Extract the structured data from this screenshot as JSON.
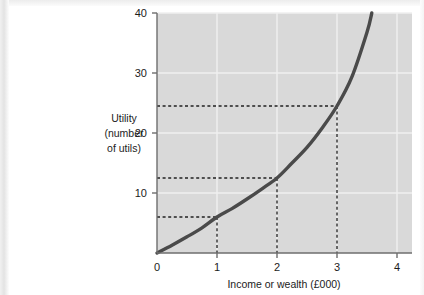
{
  "figure": {
    "background_color": "#ffffff",
    "plot_background_color": "#d9d9d9",
    "curve_color": "#4a4a4a",
    "axis_color": "#6e6e6e",
    "gridline_color": "#efefef",
    "text_color": "#1c1c1c"
  },
  "chart_data": {
    "type": "line",
    "title": "",
    "subtitle": "",
    "xlabel": "Income or wealth (£000)",
    "ylabel": "Utility (number of utils)",
    "ylabel_lines": [
      "Utility",
      "(number",
      "of utils)"
    ],
    "xlim": [
      0,
      4.25
    ],
    "ylim": [
      0,
      40
    ],
    "xticks": [
      0,
      1,
      2,
      3,
      4
    ],
    "xticklabels": [
      "0",
      "1",
      "2",
      "3",
      "4"
    ],
    "yticks": [
      10,
      20,
      30,
      40
    ],
    "yticklabels": [
      "10",
      "20",
      "30",
      "40"
    ],
    "grid": true,
    "legend": false,
    "legend_position": "none",
    "series": [
      {
        "name": "Total utility curve",
        "description": "Convex (increasing marginal utility) total-utility curve rising from the origin",
        "x": [
          0.0,
          0.25,
          0.5,
          0.75,
          1.0,
          1.25,
          1.5,
          1.75,
          2.0,
          2.25,
          2.5,
          2.75,
          3.0,
          3.25,
          3.5,
          3.58
        ],
        "y": [
          0.0,
          1.3,
          2.7,
          4.2,
          6.0,
          7.4,
          9.0,
          10.7,
          12.5,
          15.0,
          17.6,
          20.8,
          24.5,
          29.4,
          36.8,
          40.0
        ]
      }
    ],
    "annotations": [
      {
        "name": "guide-1",
        "x": 1,
        "y": 6.0,
        "style": "dashed",
        "note": "£1000 of income yields about 6 utils"
      },
      {
        "name": "guide-2",
        "x": 2,
        "y": 12.5,
        "style": "dashed",
        "note": "£2000 of income yields about 12.5 utils"
      },
      {
        "name": "guide-3",
        "x": 3,
        "y": 24.5,
        "style": "dashed",
        "note": "£3000 of income yields about 24.5 utils"
      }
    ]
  }
}
